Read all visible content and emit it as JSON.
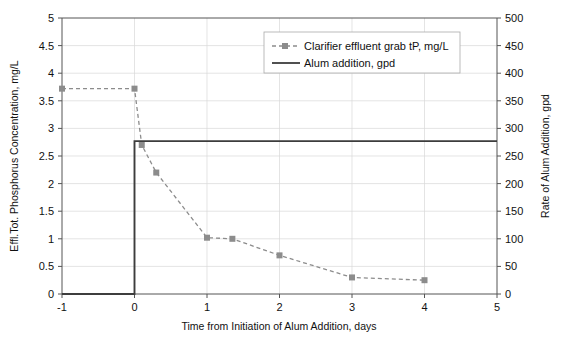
{
  "chart_data": {
    "type": "line",
    "title": "",
    "xlabel": "Time from Initiation of Alum Addition, days",
    "ylabel": "Effl.Tot. Phosphorus Concentration, mg/L",
    "y2label": "Rate of Alum Addition, gpd",
    "xlim": [
      -1,
      5
    ],
    "ylim": [
      0,
      5
    ],
    "y2lim": [
      0,
      500
    ],
    "xticks": [
      "-1",
      "0",
      "1",
      "2",
      "3",
      "4",
      "5"
    ],
    "xtick_values": [
      -1,
      0,
      1,
      2,
      3,
      4,
      5
    ],
    "yticks": [
      "0",
      "0.5",
      "1",
      "1.5",
      "2",
      "2.5",
      "3",
      "3.5",
      "4",
      "4.5",
      "5"
    ],
    "ytick_values": [
      0,
      0.5,
      1,
      1.5,
      2,
      2.5,
      3,
      3.5,
      4,
      4.5,
      5
    ],
    "y2ticks": [
      "0",
      "50",
      "100",
      "150",
      "200",
      "250",
      "300",
      "350",
      "400",
      "450",
      "500"
    ],
    "y2tick_values": [
      0,
      50,
      100,
      150,
      200,
      250,
      300,
      350,
      400,
      450,
      500
    ],
    "grid": true,
    "legend_position": "top-center-right",
    "series": [
      {
        "name": "Clarifier effluent grab tP, mg/L",
        "axis": "left",
        "style": "dashed",
        "marker": "square",
        "color": "#8c8c8c",
        "points": [
          {
            "x": -1.0,
            "y": 3.72
          },
          {
            "x": 0.0,
            "y": 3.72
          },
          {
            "x": 0.1,
            "y": 2.7
          },
          {
            "x": 0.3,
            "y": 2.2
          },
          {
            "x": 1.0,
            "y": 1.02
          },
          {
            "x": 1.35,
            "y": 1.0
          },
          {
            "x": 2.0,
            "y": 0.7
          },
          {
            "x": 3.0,
            "y": 0.3
          },
          {
            "x": 4.0,
            "y": 0.25
          }
        ]
      },
      {
        "name": "Alum addition, gpd",
        "axis": "right",
        "style": "solid",
        "marker": "none",
        "color": "#3d3d3d",
        "points": [
          {
            "x": -1.0,
            "y": 0
          },
          {
            "x": 0.0,
            "y": 0
          },
          {
            "x": 0.0,
            "y": 277
          },
          {
            "x": 5.0,
            "y": 277
          }
        ]
      }
    ],
    "annotations": []
  },
  "colors": {
    "grid": "#d8d8d8",
    "axis": "#555555",
    "series_dashed": "#8c8c8c",
    "series_solid": "#3d3d3d",
    "text": "#111111",
    "legend_border": "#aaaaaa",
    "background": "#ffffff"
  },
  "legend": {
    "items": [
      {
        "label": "Clarifier effluent grab tP, mg/L",
        "style": "dashed-marker"
      },
      {
        "label": "Alum addition, gpd",
        "style": "solid"
      }
    ]
  }
}
